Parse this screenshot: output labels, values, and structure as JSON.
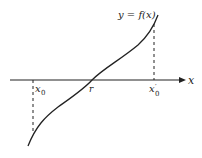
{
  "diagram": {
    "curve_label": "y = f(x)",
    "axis_label": "x",
    "points": {
      "x0": "x",
      "x0_sub": "0",
      "r": "r",
      "x0_prime": "x",
      "x0_prime_sub": "0",
      "x0_prime_mark": "′"
    },
    "colors": {
      "ink": "#222222",
      "background": "#ffffff"
    }
  }
}
